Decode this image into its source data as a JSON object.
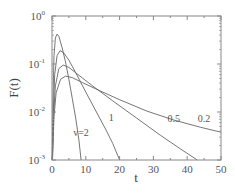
{
  "chart_data": {
    "type": "line",
    "title": "",
    "xlabel": "t",
    "ylabel": "F(t)",
    "xlim": [
      0,
      50
    ],
    "ylim": [
      0.001,
      1
    ],
    "yscale": "log",
    "grid": false,
    "legend": "inline curve labels",
    "x_ticks": [
      "0",
      "10",
      "20",
      "30",
      "40",
      "50"
    ],
    "y_ticks": [
      {
        "base": "10",
        "exp": "0"
      },
      {
        "base": "10",
        "exp": "-1"
      },
      {
        "base": "10",
        "exp": "-2"
      },
      {
        "base": "10",
        "exp": "-3"
      }
    ],
    "series": [
      {
        "name": "v=2",
        "label": "v=2",
        "label_pos": [
          8.6,
          0.0032
        ],
        "x": [
          0.05,
          0.3,
          0.6,
          1.0,
          1.5,
          2.0,
          3.0,
          4.0,
          5.0,
          6.0,
          7.0,
          8.0,
          8.6
        ],
        "y": [
          0.001,
          0.02,
          0.15,
          0.35,
          0.42,
          0.38,
          0.22,
          0.11,
          0.048,
          0.019,
          0.0075,
          0.0025,
          0.001
        ]
      },
      {
        "name": "v=1",
        "label": "1",
        "label_pos": [
          17.5,
          0.0065
        ],
        "x": [
          0.08,
          0.4,
          0.8,
          1.5,
          2.4,
          3.5,
          5.0,
          7.0,
          10.0,
          13.0,
          16.0,
          18.0,
          20.0
        ],
        "y": [
          0.001,
          0.012,
          0.06,
          0.15,
          0.19,
          0.17,
          0.12,
          0.066,
          0.026,
          0.0105,
          0.0042,
          0.0022,
          0.001
        ]
      },
      {
        "name": "v=0.5",
        "label": "0.5",
        "label_pos": [
          36,
          0.0062
        ],
        "x": [
          0.12,
          0.5,
          1.0,
          2.0,
          3.3,
          5.0,
          8.0,
          12.0,
          18.0,
          25.0,
          32.0,
          38.0,
          43.0
        ],
        "y": [
          0.001,
          0.009,
          0.035,
          0.08,
          0.095,
          0.085,
          0.058,
          0.035,
          0.017,
          0.0075,
          0.0033,
          0.0017,
          0.001
        ]
      },
      {
        "name": "v=0.2",
        "label": "0.2",
        "label_pos": [
          45,
          0.0062
        ],
        "x": [
          0.15,
          0.6,
          1.2,
          2.5,
          4.0,
          6.0,
          9.0,
          14.0,
          20.0,
          28.0,
          36.0,
          44.0,
          50.0
        ],
        "y": [
          0.001,
          0.008,
          0.025,
          0.048,
          0.056,
          0.052,
          0.041,
          0.028,
          0.018,
          0.0105,
          0.0068,
          0.0048,
          0.0038
        ]
      }
    ]
  }
}
